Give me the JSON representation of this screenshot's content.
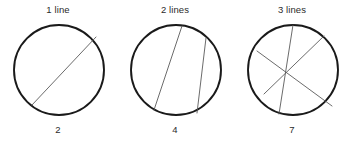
{
  "figure": {
    "caption_style": "circle-chord-regions",
    "background_color": "#ffffff",
    "circle_stroke_color": "#1a1a1a",
    "chord_stroke_color": "#5a5a5a",
    "text_color": "#2b2b2b"
  },
  "panels": [
    {
      "id": "panel-1",
      "title": "1 line",
      "count": "2",
      "lines": 1,
      "regions": 2
    },
    {
      "id": "panel-2",
      "title": "2 lines",
      "count": "4",
      "lines": 2,
      "regions": 4
    },
    {
      "id": "panel-3",
      "title": "3 lines",
      "count": "7",
      "lines": 3,
      "regions": 7
    }
  ],
  "chart_data": {
    "type": "scatter",
    "title": "",
    "xlabel": "lines",
    "ylabel": "regions",
    "x": [
      1,
      2,
      3
    ],
    "y": [
      2,
      4,
      7
    ],
    "categories": [
      "1 line",
      "2 lines",
      "3 lines"
    ],
    "values": [
      2,
      4,
      7
    ],
    "tick_labels_top": [
      "1 line",
      "2 lines",
      "3 lines"
    ],
    "tick_labels_bottom": [
      "2",
      "4",
      "7"
    ],
    "grid": false,
    "legend": "none",
    "annotations": [
      "A circle cut by 1 chord yields 2 regions",
      "A circle cut by 2 chords yields 4 regions",
      "A circle cut by 3 chords yields 7 regions"
    ],
    "geometry": {
      "circle": {
        "cx": 47,
        "cy": 48,
        "r": 45
      },
      "chords": {
        "panel-1": [
          {
            "x1": 84,
            "y1": 15,
            "x2": 20,
            "y2": 83
          }
        ],
        "panel-2": [
          {
            "x1": 53,
            "y1": 4,
            "x2": 25,
            "y2": 88
          },
          {
            "x1": 77,
            "y1": 16,
            "x2": 68,
            "y2": 91
          }
        ],
        "panel-3": [
          {
            "x1": 47,
            "y1": 3,
            "x2": 33,
            "y2": 92
          },
          {
            "x1": 78,
            "y1": 14,
            "x2": 18,
            "y2": 72
          },
          {
            "x1": 11,
            "y1": 29,
            "x2": 86,
            "y2": 84
          }
        ]
      }
    }
  }
}
